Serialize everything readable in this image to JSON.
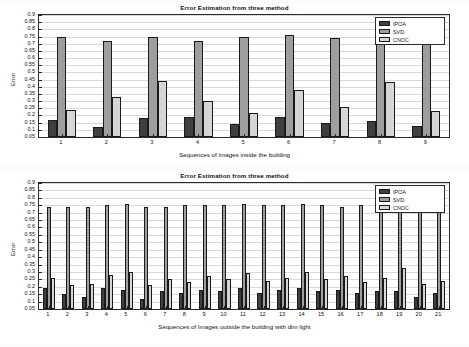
{
  "figure": {
    "background": "#fcfcfc",
    "series_colors": {
      "IPOA": "#3f3f3f",
      "SVD": "#9e9e9e",
      "CNOC": "#d6d6d6"
    }
  },
  "chart_data": [
    {
      "type": "bar",
      "title": "Error Estimation from three method",
      "xlabel": "Sequences of Images inside the building",
      "ylabel": "Error",
      "categories": [
        "1",
        "2",
        "3",
        "4",
        "5",
        "6",
        "7",
        "8",
        "9"
      ],
      "ylim": [
        0.05,
        0.9
      ],
      "yticks": [
        "0.05",
        "0.1",
        "0.15",
        "0.2",
        "0.25",
        "0.3",
        "0.35",
        "0.4",
        "0.45",
        "0.5",
        "0.55",
        "0.6",
        "0.65",
        "0.7",
        "0.75",
        "0.8",
        "0.85",
        "0.9"
      ],
      "grid": true,
      "legend": [
        "IPOA",
        "SVD",
        "CNOC"
      ],
      "legend_position": "top-right",
      "series": [
        {
          "name": "IPOA",
          "values": [
            0.17,
            0.12,
            0.18,
            0.19,
            0.14,
            0.19,
            0.15,
            0.16,
            0.13
          ]
        },
        {
          "name": "SVD",
          "values": [
            0.75,
            0.72,
            0.75,
            0.72,
            0.75,
            0.76,
            0.74,
            0.75,
            0.75
          ]
        },
        {
          "name": "CNOC",
          "values": [
            0.24,
            0.33,
            0.44,
            0.3,
            0.22,
            0.38,
            0.26,
            0.43,
            0.23
          ]
        }
      ]
    },
    {
      "type": "bar",
      "title": "Error Estimation from three method",
      "xlabel": "Sequences of Images outside the building with dim light",
      "ylabel": "Error",
      "categories": [
        "1",
        "2",
        "3",
        "4",
        "5",
        "6",
        "7",
        "8",
        "9",
        "10",
        "11",
        "12",
        "13",
        "14",
        "15",
        "16",
        "17",
        "18",
        "19",
        "20",
        "21"
      ],
      "ylim": [
        0.05,
        0.9
      ],
      "yticks": [
        "0.05",
        "0.1",
        "0.15",
        "0.2",
        "0.25",
        "0.3",
        "0.35",
        "0.4",
        "0.45",
        "0.5",
        "0.55",
        "0.6",
        "0.65",
        "0.7",
        "0.75",
        "0.8",
        "0.85",
        "0.9"
      ],
      "grid": true,
      "legend": [
        "IPOA",
        "SVD",
        "CNOC"
      ],
      "legend_position": "top-right",
      "series": [
        {
          "name": "IPOA",
          "values": [
            0.19,
            0.15,
            0.13,
            0.19,
            0.18,
            0.12,
            0.17,
            0.16,
            0.18,
            0.17,
            0.19,
            0.16,
            0.18,
            0.19,
            0.17,
            0.18,
            0.16,
            0.17,
            0.17,
            0.13,
            0.16
          ]
        },
        {
          "name": "SVD",
          "values": [
            0.74,
            0.74,
            0.74,
            0.75,
            0.76,
            0.74,
            0.74,
            0.75,
            0.75,
            0.75,
            0.76,
            0.75,
            0.75,
            0.76,
            0.75,
            0.74,
            0.75,
            0.75,
            0.76,
            0.74,
            0.75
          ]
        },
        {
          "name": "CNOC",
          "values": [
            0.26,
            0.21,
            0.22,
            0.28,
            0.3,
            0.21,
            0.25,
            0.23,
            0.27,
            0.25,
            0.29,
            0.24,
            0.26,
            0.3,
            0.25,
            0.27,
            0.23,
            0.26,
            0.33,
            0.22,
            0.24
          ]
        }
      ]
    }
  ]
}
